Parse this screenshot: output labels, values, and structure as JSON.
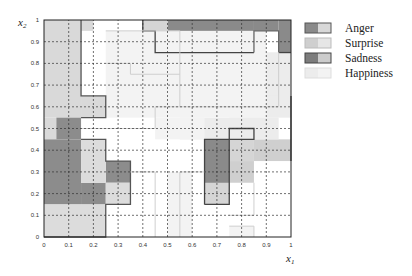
{
  "chart_data": {
    "type": "heatmap",
    "title": "",
    "xlabel": "x1",
    "ylabel": "x2",
    "xlim": [
      0,
      1
    ],
    "ylim": [
      0,
      1
    ],
    "grid": true,
    "legend_position": "right",
    "x_ticks": [
      "0",
      "0.1",
      "0.2",
      "0.3",
      "0.4",
      "0.5",
      "0.6",
      "0.7",
      "0.8",
      "0.9",
      "1"
    ],
    "y_ticks": [
      "0",
      "0.1",
      "0.2",
      "0.3",
      "0.4",
      "0.5",
      "0.6",
      "0.7",
      "0.8",
      "0.9",
      "1"
    ],
    "legend": [
      {
        "name": "Anger",
        "color": "#8a8a8a",
        "secondary": "#d8d8d8",
        "border": "#555555"
      },
      {
        "name": "Surprise",
        "color": "#cfcfcf",
        "secondary": "#e6e6e6",
        "border": "#bbbbbb"
      },
      {
        "name": "Sadness",
        "color": "#7d7d7d",
        "secondary": "#cccccc",
        "border": "#444444"
      },
      {
        "name": "Happiness",
        "color": "#ececec",
        "secondary": "#f3f3f3",
        "border": "#dddddd"
      }
    ],
    "cell_size": 0.05,
    "regions": [
      {
        "class": "Surprise",
        "shade": "#d9d9d9",
        "cells": [
          [
            0,
            0.55,
            0.15,
            1.0
          ],
          [
            0.15,
            0.55,
            0.25,
            0.65
          ],
          [
            0,
            0.45,
            0.05,
            0.55
          ],
          [
            0.15,
            0.95,
            0.2,
            1.0
          ]
        ]
      },
      {
        "class": "Sadness",
        "shade": "#8c8c8c",
        "cells": [
          [
            0.05,
            0.45,
            0.15,
            0.55
          ],
          [
            0,
            0.15,
            0.15,
            0.45
          ],
          [
            0.15,
            0.15,
            0.25,
            0.25
          ],
          [
            0.25,
            0.25,
            0.35,
            0.35
          ]
        ]
      },
      {
        "class": "Surprise",
        "shade": "#dcdcdc",
        "cells": [
          [
            0,
            0,
            0.25,
            0.15
          ],
          [
            0.15,
            0.25,
            0.25,
            0.45
          ],
          [
            0.25,
            0.15,
            0.35,
            0.25
          ]
        ]
      },
      {
        "class": "Anger",
        "shade": "#8a8a8a",
        "cells": [
          [
            0.5,
            0.85,
            0.85,
            1.0
          ],
          [
            0.85,
            0.95,
            0.95,
            1.0
          ],
          [
            0.95,
            0.85,
            1.0,
            1.0
          ]
        ]
      },
      {
        "class": "Anger",
        "shade": "#d5d5d5",
        "cells": [
          [
            0.4,
            0.95,
            0.5,
            1.0
          ],
          [
            0.45,
            0.85,
            0.5,
            0.95
          ]
        ]
      },
      {
        "class": "Anger",
        "shade": "#8a8a8a",
        "cells": [
          [
            0.65,
            0.15,
            0.75,
            0.45
          ]
        ]
      },
      {
        "class": "Anger",
        "shade": "#d5d5d5",
        "cells": [
          [
            0.65,
            0.15,
            0.75,
            0.25
          ],
          [
            0.75,
            0.35,
            0.85,
            0.45
          ]
        ]
      },
      {
        "class": "Surprise",
        "shade": "#cfcfcf",
        "cells": [
          [
            0.75,
            0.25,
            0.85,
            0.35
          ],
          [
            0.85,
            0.35,
            1.0,
            0.45
          ]
        ]
      },
      {
        "class": "Happiness",
        "shade": "#ececec",
        "cells": [
          [
            0.9,
            0.55,
            1.0,
            0.85
          ],
          [
            0.75,
            0.55,
            0.9,
            0.65
          ],
          [
            0.55,
            0.45,
            0.95,
            0.55
          ],
          [
            0.85,
            0.65,
            0.95,
            0.85
          ]
        ]
      },
      {
        "class": "Happiness",
        "shade": "#f3f3f3",
        "cells": [
          [
            0.25,
            0.55,
            0.9,
            0.95
          ],
          [
            0.45,
            0.45,
            0.65,
            0.55
          ],
          [
            0.5,
            0.0,
            0.6,
            0.3
          ],
          [
            0.75,
            0.0,
            0.85,
            0.05
          ]
        ]
      }
    ]
  }
}
